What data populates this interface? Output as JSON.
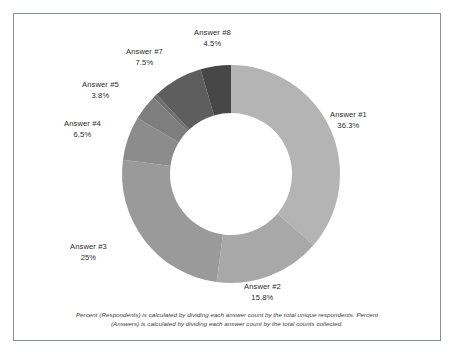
{
  "frame": {
    "border_color": "#8a8f94",
    "background_color": "#ffffff"
  },
  "footnote": {
    "line1": "Percent (Respondents) is calculated by dividing each answer count by the total unique respondents. Percent",
    "line2": "(Answers) is calculated by dividing each answer count by the total counts collected."
  },
  "chart_data": {
    "type": "pie",
    "variant": "donut",
    "title": "",
    "subtitle": "",
    "xlabel": "",
    "ylabel": "",
    "legend_position": "none",
    "labels_position": "outside",
    "start_angle_deg": 0,
    "direction": "clockwise",
    "inner_radius_ratio": 0.56,
    "categories": [
      "Answer #1",
      "Answer #2",
      "Answer #3",
      "Answer #4",
      "Answer #5",
      "Answer #6",
      "Answer #7",
      "Answer #8"
    ],
    "values": [
      36.3,
      15.8,
      25,
      6.5,
      3.8,
      0.6,
      7.5,
      4.5
    ],
    "value_labels": [
      "36.3%",
      "15.8%",
      "25%",
      "6.5%",
      "3.8%",
      "",
      "7.5%",
      "4.5%"
    ],
    "colors": [
      "#b4b4b4",
      "#a8a8a8",
      "#9a9a9a",
      "#8c8c8c",
      "#7e7e7e",
      "#6f6f6f",
      "#5e5e5e",
      "#474747"
    ],
    "slices": [
      {
        "name": "Answer #1",
        "percent_label": "36.3%",
        "value": 36.3,
        "color": "#b4b4b4"
      },
      {
        "name": "Answer #2",
        "percent_label": "15.8%",
        "value": 15.8,
        "color": "#a8a8a8"
      },
      {
        "name": "Answer #3",
        "percent_label": "25%",
        "value": 25,
        "color": "#9a9a9a"
      },
      {
        "name": "Answer #4",
        "percent_label": "6.5%",
        "value": 6.5,
        "color": "#8c8c8c"
      },
      {
        "name": "Answer #5",
        "percent_label": "3.8%",
        "value": 3.8,
        "color": "#7e7e7e"
      },
      {
        "name": "Answer #6",
        "percent_label": "",
        "value": 0.6,
        "color": "#6f6f6f"
      },
      {
        "name": "Answer #7",
        "percent_label": "7.5%",
        "value": 7.5,
        "color": "#5e5e5e"
      },
      {
        "name": "Answer #8",
        "percent_label": "4.5%",
        "value": 4.5,
        "color": "#474747"
      }
    ]
  },
  "labels": {
    "answer1": {
      "name": "Answer #1",
      "pct": "36.3%"
    },
    "answer2": {
      "name": "Answer #2",
      "pct": "15.8%"
    },
    "answer3": {
      "name": "Answer #3",
      "pct": "25%"
    },
    "answer4": {
      "name": "Answer #4",
      "pct": "6.5%"
    },
    "answer5": {
      "name": "Answer #5",
      "pct": "3.8%"
    },
    "answer7": {
      "name": "Answer #7",
      "pct": "7.5%"
    },
    "answer8": {
      "name": "Answer #8",
      "pct": "4.5%"
    }
  }
}
